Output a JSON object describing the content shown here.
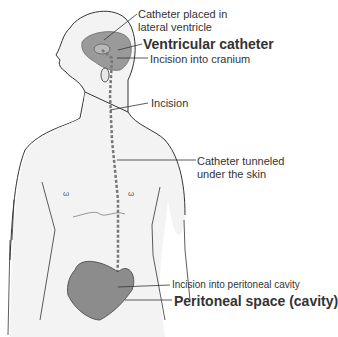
{
  "diagram": {
    "type": "anatomical illustration - ventriculoperitoneal shunt",
    "labels": {
      "catheter_placed_line1": "Catheter placed in",
      "catheter_placed_line2": "lateral ventricle",
      "ventricular_catheter": "Ventricular catheter",
      "incision_cranium": "Incision into cranium",
      "incision": "Incision",
      "tunneled_line1": "Catheter tunneled",
      "tunneled_line2": "under the skin",
      "incision_peritoneal": "Incision into peritoneal cavity",
      "peritoneal_space": "Peritoneal space (cavity)"
    },
    "colors": {
      "skin": "#f2f2f2",
      "outline": "#333333",
      "brain": "#9a9a9a",
      "peritoneal": "#8c8c8c",
      "text": "#333333"
    }
  }
}
